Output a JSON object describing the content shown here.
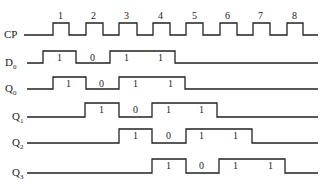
{
  "diagram": {
    "type": "timing",
    "clock": {
      "name": "CP",
      "pulse_labels": [
        "1",
        "2",
        "3",
        "4",
        "5",
        "6",
        "7",
        "8"
      ]
    },
    "signals": [
      {
        "name": "D",
        "sub": "0",
        "bits": [
          "1",
          "0",
          "1",
          "1"
        ]
      },
      {
        "name": "Q",
        "sub": "0",
        "bits": [
          "1",
          "0",
          "1",
          "1"
        ]
      },
      {
        "name": "Q",
        "sub": "1",
        "bits": [
          "1",
          "0",
          "1",
          "1"
        ]
      },
      {
        "name": "Q",
        "sub": "2",
        "bits": [
          "1",
          "0",
          "1",
          "1"
        ]
      },
      {
        "name": "Q",
        "sub": "3",
        "bits": [
          "1",
          "0",
          "1",
          "1"
        ]
      }
    ]
  }
}
